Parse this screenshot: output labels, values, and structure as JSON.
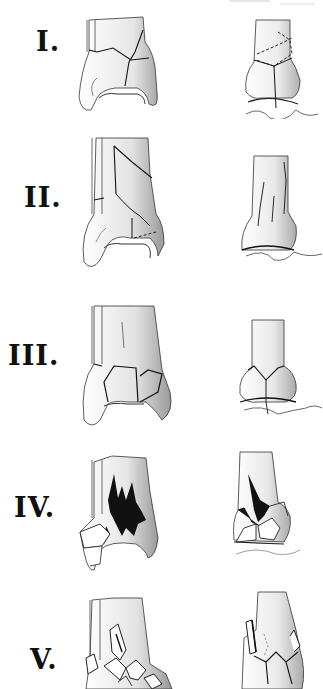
{
  "figure": {
    "type": "medical-illustration",
    "colors": {
      "ink": "#111111",
      "shade": "#8a8a8a",
      "background": "#ffffff"
    },
    "rows": [
      {
        "label": "I.",
        "views": [
          "anterior-view",
          "lateral-view"
        ]
      },
      {
        "label": "II.",
        "views": [
          "anterior-view",
          "lateral-view"
        ]
      },
      {
        "label": "III.",
        "views": [
          "anterior-view",
          "lateral-view"
        ]
      },
      {
        "label": "IV.",
        "views": [
          "anterior-view",
          "lateral-view"
        ]
      },
      {
        "label": "V.",
        "views": [
          "anterior-view",
          "lateral-view"
        ]
      }
    ]
  }
}
